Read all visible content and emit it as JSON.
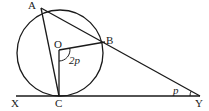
{
  "diagram": {
    "type": "geometry",
    "points": {
      "A": {
        "label": "A",
        "x": 41,
        "y": 8
      },
      "B": {
        "label": "B",
        "x": 105,
        "y": 42
      },
      "O": {
        "label": "O",
        "x": 59,
        "y": 50
      },
      "C": {
        "label": "C",
        "x": 59,
        "y": 96
      },
      "X": {
        "label": "X",
        "x": 16,
        "y": 96
      },
      "Y": {
        "label": "Y",
        "x": 200,
        "y": 96
      }
    },
    "circle": {
      "center": "O",
      "cx": 60,
      "cy": 53,
      "r": 43
    },
    "segments": [
      [
        "A",
        "Y"
      ],
      [
        "A",
        "C"
      ],
      [
        "O",
        "B"
      ],
      [
        "O",
        "C"
      ],
      [
        "X",
        "Y"
      ]
    ],
    "angles": {
      "BOC": {
        "label": "2p",
        "at": "O"
      },
      "AYX": {
        "label": "p",
        "at": "Y"
      }
    },
    "colors": {
      "ink": "#1a1a1a",
      "background": "#ffffff"
    }
  }
}
